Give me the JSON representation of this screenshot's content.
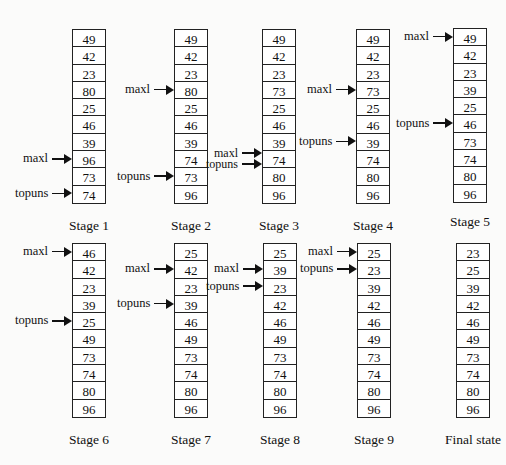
{
  "diagram": {
    "stages": [
      {
        "label": "Stage 1",
        "values": [
          49,
          42,
          23,
          80,
          25,
          46,
          39,
          96,
          73,
          74
        ],
        "pointers": [
          {
            "name": "maxl",
            "index": 7
          },
          {
            "name": "topuns",
            "index": 9
          }
        ]
      },
      {
        "label": "Stage 2",
        "values": [
          49,
          42,
          23,
          80,
          25,
          46,
          39,
          74,
          73,
          96
        ],
        "pointers": [
          {
            "name": "maxl",
            "index": 3
          },
          {
            "name": "topuns",
            "index": 8
          }
        ]
      },
      {
        "label": "Stage 3",
        "values": [
          49,
          42,
          23,
          73,
          25,
          46,
          39,
          74,
          80,
          96
        ],
        "pointers": [
          {
            "name": "maxl",
            "index": 7
          },
          {
            "name": "topuns",
            "index": 7
          }
        ]
      },
      {
        "label": "Stage 4",
        "values": [
          49,
          42,
          23,
          73,
          25,
          46,
          39,
          74,
          80,
          96
        ],
        "pointers": [
          {
            "name": "maxl",
            "index": 3
          },
          {
            "name": "topuns",
            "index": 6
          }
        ]
      },
      {
        "label": "Stage 5",
        "values": [
          49,
          42,
          23,
          39,
          25,
          46,
          73,
          74,
          80,
          96
        ],
        "pointers": [
          {
            "name": "maxl",
            "index": 0
          },
          {
            "name": "topuns",
            "index": 5
          }
        ]
      },
      {
        "label": "Stage 6",
        "values": [
          46,
          42,
          23,
          39,
          25,
          49,
          73,
          74,
          80,
          96
        ],
        "pointers": [
          {
            "name": "maxl",
            "index": 0
          },
          {
            "name": "topuns",
            "index": 4
          }
        ]
      },
      {
        "label": "Stage 7",
        "values": [
          25,
          42,
          23,
          39,
          46,
          49,
          73,
          74,
          80,
          96
        ],
        "pointers": [
          {
            "name": "maxl",
            "index": 1
          },
          {
            "name": "topuns",
            "index": 3
          }
        ]
      },
      {
        "label": "Stage 8",
        "values": [
          25,
          39,
          23,
          42,
          46,
          49,
          73,
          74,
          80,
          96
        ],
        "pointers": [
          {
            "name": "maxl",
            "index": 1
          },
          {
            "name": "topuns",
            "index": 2
          }
        ]
      },
      {
        "label": "Stage 9",
        "values": [
          25,
          23,
          39,
          42,
          46,
          49,
          73,
          74,
          80,
          96
        ],
        "pointers": [
          {
            "name": "maxl",
            "index": 0
          },
          {
            "name": "topuns",
            "index": 1
          }
        ]
      },
      {
        "label": "Final state",
        "values": [
          23,
          25,
          39,
          42,
          46,
          49,
          73,
          74,
          80,
          96
        ],
        "pointers": []
      }
    ]
  }
}
